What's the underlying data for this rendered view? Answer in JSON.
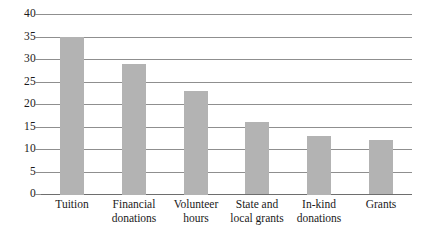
{
  "chart_data": {
    "type": "bar",
    "title": "",
    "subtitle": "",
    "xlabel": "",
    "ylabel": "",
    "categories": [
      "Tuition",
      "Financial donations",
      "Volunteer hours",
      "State and local grants",
      "In-kind donations",
      "Grants"
    ],
    "category_lines": [
      [
        "Tuition"
      ],
      [
        "Financial",
        "donations"
      ],
      [
        "Volunteer",
        "hours"
      ],
      [
        "State and",
        "local grants"
      ],
      [
        "In-kind",
        "donations"
      ],
      [
        "Grants"
      ]
    ],
    "values": [
      35,
      29,
      23,
      16,
      13,
      12
    ],
    "ylim": [
      0,
      40
    ],
    "ytick_labels": [
      "40",
      "35",
      "30",
      "25",
      "20",
      "15",
      "10",
      "5",
      "0"
    ],
    "ytick_values": [
      40,
      35,
      30,
      25,
      20,
      15,
      10,
      5,
      0
    ],
    "ystep": 5,
    "grid": true,
    "legend": false,
    "legend_position": "none",
    "colors": {
      "bar_fill": "#b3b3b3",
      "gridline": "#8f8f8f",
      "baseline": "#6e6e6e",
      "text": "#1a1a1a",
      "background": "#ffffff"
    }
  }
}
